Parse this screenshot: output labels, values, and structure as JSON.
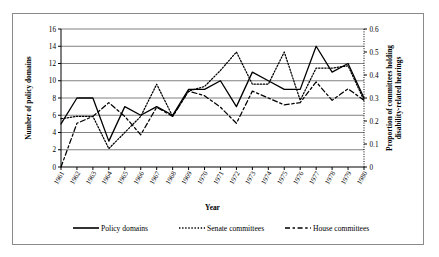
{
  "chart_data": {
    "type": "line",
    "title": "",
    "xlabel": "Year",
    "ylabel": "Number of policy domains",
    "y2label": "Proportion of committees holding disability-related hearings",
    "categories": [
      "1961",
      "1962",
      "1963",
      "1964",
      "1965",
      "1966",
      "1967",
      "1968",
      "1969",
      "1970",
      "1971",
      "1972",
      "1973",
      "1974",
      "1975",
      "1976",
      "1977",
      "1978",
      "1979",
      "1980"
    ],
    "ylim": [
      0,
      16
    ],
    "yticks": [
      "0",
      "2",
      "4",
      "6",
      "8",
      "10",
      "12",
      "14",
      "16"
    ],
    "y2lim": [
      0,
      0.6
    ],
    "y2ticks": [
      "0",
      "0.1",
      "0.2",
      "0.3",
      "0.4",
      "0.5",
      "0.6"
    ],
    "grid": true,
    "legend_position": "bottom",
    "series": [
      {
        "name": "Policy domains",
        "axis": "left",
        "style": "solid",
        "values": [
          5,
          8,
          8,
          3,
          7,
          6,
          7,
          6,
          9,
          9,
          10,
          7,
          11,
          10,
          9,
          9,
          14,
          11,
          12,
          8
        ]
      },
      {
        "name": "Senate committees",
        "axis": "right",
        "style": "dotted",
        "values": [
          0.21,
          0.22,
          0.22,
          0.08,
          0.15,
          0.22,
          0.36,
          0.22,
          0.33,
          0.35,
          0.42,
          0.5,
          0.36,
          0.36,
          0.5,
          0.29,
          0.43,
          0.43,
          0.44,
          0.29
        ]
      },
      {
        "name": "House committees",
        "axis": "right",
        "style": "dashed",
        "values": [
          0.0,
          0.19,
          0.22,
          0.28,
          0.22,
          0.14,
          0.26,
          0.22,
          0.33,
          0.31,
          0.26,
          0.19,
          0.33,
          0.3,
          0.27,
          0.28,
          0.37,
          0.29,
          0.34,
          0.29
        ]
      }
    ]
  },
  "legend": {
    "items": [
      {
        "label": "Policy domains",
        "style": "solid"
      },
      {
        "label": "Senate committees",
        "style": "dotted"
      },
      {
        "label": "House committees",
        "style": "dashed"
      }
    ]
  },
  "colors": {
    "line": "#000000",
    "grid": "#808080",
    "axis": "#000000",
    "frame": "#8a8a8a",
    "background": "#ffffff"
  }
}
